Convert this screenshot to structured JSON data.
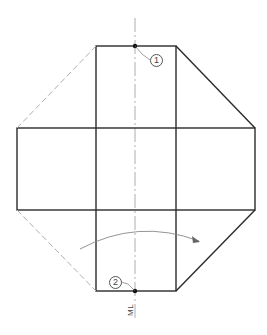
{
  "diagram": {
    "type": "technical-drawing-net",
    "colors": {
      "line": "#2b2b2b",
      "dashed": "#b0b0b0",
      "centerline": "#999999",
      "arc": "#888888"
    },
    "labels": {
      "marker_1": "1",
      "marker_2": "2",
      "centerline_label": "ML"
    }
  }
}
